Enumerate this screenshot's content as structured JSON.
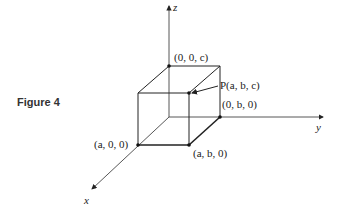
{
  "figure": {
    "caption": "Figure 4",
    "axes": {
      "x": "x",
      "y": "y",
      "z": "z"
    },
    "point_labels": {
      "top_corner": "(0, 0, c)",
      "p_point": "P(a, b, c)",
      "y_corner": "(0, b, 0)",
      "x_corner": "(a, 0, 0)",
      "xy_corner": "(a, b, 0)"
    }
  }
}
